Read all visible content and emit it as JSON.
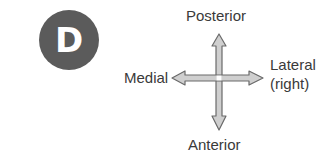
{
  "badge": {
    "letter": "D",
    "color": "#5b5b5b"
  },
  "directions": {
    "top": "Posterior",
    "bottom": "Anterior",
    "left": "Medial",
    "right_line1": "Lateral",
    "right_line2": "(right)"
  },
  "arrow": {
    "fill": "#c8c8c8",
    "stroke": "#6a6a6a",
    "icon": "four-way-arrow-icon"
  }
}
